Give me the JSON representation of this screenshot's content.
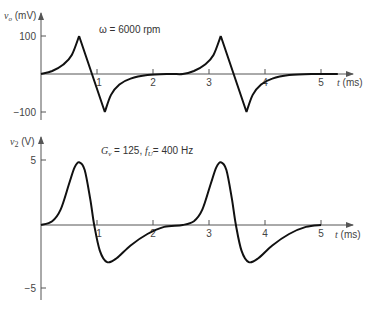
{
  "chart_data": [
    {
      "type": "line",
      "title": "",
      "annotation": "ω = 6000 rpm",
      "ylabel": "v_o (mV)",
      "xlabel": "t (ms)",
      "xlim": [
        0,
        5.5
      ],
      "ylim": [
        -110,
        120
      ],
      "xticks": [
        1,
        2,
        3,
        4,
        5
      ],
      "yticks": [
        100,
        -100
      ],
      "ytick_labels": [
        "100",
        "−100"
      ],
      "grid": false,
      "series": [
        {
          "name": "v_o",
          "description": "exponential rise to +100 mV peak, linear fall to −100 mV, exponential recovery; repeats every ~2.53 ms",
          "x": [
            0,
            0.2,
            0.4,
            0.55,
            0.68,
            0.91,
            1.14,
            1.25,
            1.4,
            1.6,
            1.9,
            2.3,
            2.53,
            2.73,
            2.93,
            3.08,
            3.21,
            3.44,
            3.67,
            3.78,
            3.93,
            4.13,
            4.43,
            4.83,
            5.3
          ],
          "values": [
            0,
            8,
            25,
            50,
            100,
            0,
            -100,
            -55,
            -28,
            -12,
            -3,
            0,
            0,
            8,
            25,
            50,
            100,
            0,
            -100,
            -55,
            -28,
            -12,
            -3,
            0,
            0
          ]
        }
      ]
    },
    {
      "type": "line",
      "title": "",
      "annotation": "G_v = 125, f_U = 400 Hz",
      "ylabel": "v_2 (V)",
      "xlabel": "t (ms)",
      "xlim": [
        0,
        5.5
      ],
      "ylim": [
        -6,
        6
      ],
      "xticks": [
        1,
        2,
        3,
        4,
        5
      ],
      "yticks": [
        5,
        -5
      ],
      "ytick_labels": [
        "5",
        "−5"
      ],
      "grid": false,
      "series": [
        {
          "name": "v_2",
          "description": "smooth bipolar pulse: +4.9 V peak near 0.68 ms, −2.9 V trough near 1.18 ms; repeats every ~2.53 ms",
          "x": [
            0,
            0.2,
            0.35,
            0.5,
            0.6,
            0.68,
            0.78,
            0.88,
            0.95,
            1.05,
            1.18,
            1.35,
            1.6,
            1.9,
            2.2,
            2.53,
            2.73,
            2.88,
            3.03,
            3.13,
            3.21,
            3.31,
            3.41,
            3.48,
            3.58,
            3.71,
            3.88,
            4.13,
            4.43,
            4.73,
            5.0
          ],
          "values": [
            0,
            0.3,
            1.2,
            3.2,
            4.5,
            4.9,
            4.3,
            2.0,
            0,
            -2.0,
            -2.9,
            -2.6,
            -1.6,
            -0.7,
            -0.15,
            0,
            0.3,
            1.2,
            3.2,
            4.5,
            4.9,
            4.3,
            2.0,
            0,
            -2.0,
            -2.9,
            -2.6,
            -1.6,
            -0.7,
            -0.15,
            0
          ]
        }
      ]
    }
  ],
  "plots": [
    {
      "ylabel_var": "v",
      "ylabel_sub": "o",
      "ylabel_unit": " (mV)",
      "annotation": "ω = 6000 rpm",
      "xlabel": "t (ms)",
      "xtick_labels": [
        "1",
        "2",
        "3",
        "4",
        "5"
      ],
      "ytick_labels": [
        "100",
        "−100"
      ]
    },
    {
      "ylabel_var": "v",
      "ylabel_sub": "2",
      "ylabel_unit": " (V)",
      "annotation_G": "G",
      "annotation_Gsub": "v",
      "annotation_mid": " = 125, ",
      "annotation_f": "f",
      "annotation_fsub": "U",
      "annotation_end": "= 400 Hz",
      "xlabel": "t (ms)",
      "xtick_labels": [
        "1",
        "2",
        "3",
        "4",
        "5"
      ],
      "ytick_labels": [
        "5",
        "−5"
      ]
    }
  ],
  "colors": {
    "curve": "#111111",
    "axis": "#555555",
    "text": "#444444"
  }
}
